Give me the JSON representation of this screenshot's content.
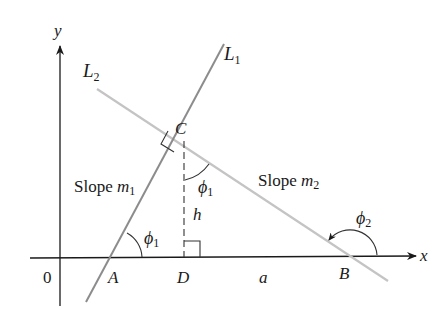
{
  "diagram": {
    "type": "geometry",
    "colors": {
      "axes": "#1a1a1a",
      "line_L1": "#8c8c8c",
      "line_L2": "#c4c4c4",
      "marks": "#333333"
    },
    "axes": {
      "x_label": "x",
      "y_label": "y",
      "origin_label": "0"
    },
    "lines": [
      {
        "name": "L",
        "subscript": "1"
      },
      {
        "name": "L",
        "subscript": "2"
      }
    ],
    "points": {
      "A": "A",
      "B": "B",
      "C": "C",
      "D": "D"
    },
    "labels": {
      "slope1_text": "Slope ",
      "slope1_var": "m",
      "slope1_sub": "1",
      "slope2_text": "Slope ",
      "slope2_var": "m",
      "slope2_sub": "2",
      "h": "h",
      "a": "a",
      "phi": "ϕ",
      "phi1_sub": "1",
      "phi2_sub": "2"
    }
  }
}
